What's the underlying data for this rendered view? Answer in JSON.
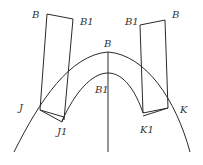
{
  "diagram": {
    "type": "geometric construction",
    "labels": {
      "left_strip_top_left": "B",
      "left_strip_top_right": "B1",
      "right_strip_top_left": "B1",
      "right_strip_top_right": "B",
      "outer_arc_apex": "B",
      "inner_arc_apex": "B1",
      "left_outer": "J",
      "left_inner": "J1",
      "right_inner": "K1",
      "right_outer": "K"
    },
    "colors": {
      "stroke": "#2a2a2a",
      "text": "#333333",
      "background": "#ffffff"
    }
  }
}
